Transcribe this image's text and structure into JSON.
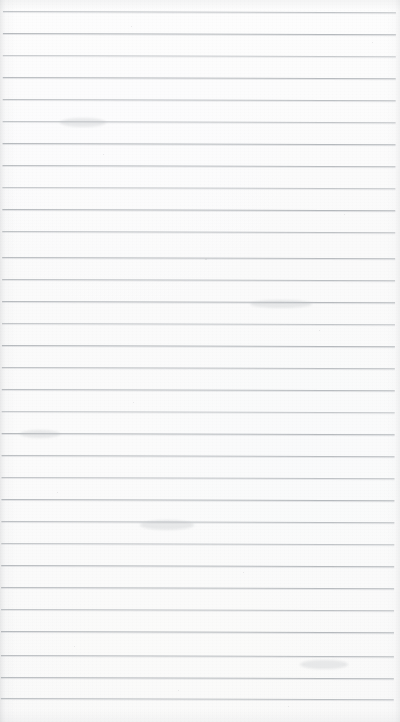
{
  "page": {
    "kind": "lined-notepad-page",
    "width": 400,
    "height": 722,
    "content_text": "",
    "handwriting_present": false,
    "printed_text_present": false
  },
  "paper": {
    "background_color": "#fbfbfb",
    "background_color_top": "#fdfdfd",
    "background_color_bottom": "#f9f9f9",
    "texture": "fine scan grain",
    "edge_shadow_color": "#aaacaf"
  },
  "ruling": {
    "line_color": "#b2b6ba",
    "line_highlight_color": "#cdd0d3",
    "line_thickness_px": 1,
    "line_spacing_px": 22,
    "first_line_y_px": 11,
    "line_count": 32,
    "line_left_x_px": 3,
    "line_right_x_px": 396,
    "skew_degrees": 0.18,
    "orientation": "horizontal",
    "margin_rule_present": false,
    "lines_y": [
      11,
      33,
      55,
      77,
      99,
      121,
      143,
      165,
      187,
      209,
      231,
      257,
      279,
      301,
      323,
      345,
      367,
      389,
      411,
      433,
      455,
      477,
      499,
      521,
      543,
      565,
      587,
      609,
      631,
      655,
      677,
      698
    ],
    "line_opacities": [
      0.8,
      0.95,
      0.7,
      0.92,
      0.85,
      0.78,
      0.95,
      0.88,
      0.74,
      0.96,
      0.82,
      0.9,
      0.86,
      0.93,
      0.76,
      0.95,
      0.84,
      0.9,
      0.72,
      0.94,
      0.88,
      0.8,
      0.95,
      0.86,
      0.78,
      0.93,
      0.9,
      0.82,
      0.95,
      0.88,
      0.92,
      0.86
    ]
  },
  "artifacts": {
    "specks": [
      {
        "x": 131,
        "y": 26,
        "size": 1.4
      },
      {
        "x": 372,
        "y": 42,
        "size": 1.2
      },
      {
        "x": 103,
        "y": 154,
        "size": 1.1
      },
      {
        "x": 205,
        "y": 258,
        "size": 1.5
      },
      {
        "x": 133,
        "y": 402,
        "size": 1.3
      },
      {
        "x": 243,
        "y": 572,
        "size": 1.4
      },
      {
        "x": 74,
        "y": 646,
        "size": 1.2
      },
      {
        "x": 288,
        "y": 706,
        "size": 1.3
      },
      {
        "x": 319,
        "y": 330,
        "size": 1.1
      },
      {
        "x": 57,
        "y": 492,
        "size": 1.2
      },
      {
        "x": 178,
        "y": 690,
        "size": 1.1
      },
      {
        "x": 344,
        "y": 214,
        "size": 1.2
      }
    ],
    "smudges": [
      {
        "x": 60,
        "y": 118,
        "w": 46,
        "h": 9
      },
      {
        "x": 250,
        "y": 300,
        "w": 62,
        "h": 8
      },
      {
        "x": 140,
        "y": 520,
        "w": 54,
        "h": 10
      },
      {
        "x": 300,
        "y": 660,
        "w": 48,
        "h": 9
      },
      {
        "x": 20,
        "y": 430,
        "w": 40,
        "h": 8
      }
    ]
  }
}
